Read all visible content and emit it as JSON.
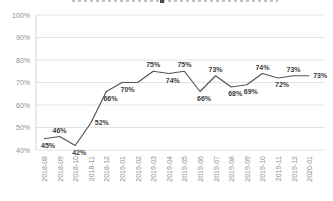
{
  "chart_data": {
    "type": "line",
    "title": "",
    "title_cropped": true,
    "categories": [
      "2018-08",
      "2018-09",
      "2018-10",
      "2018-11",
      "2018-12",
      "2019-01",
      "2019-02",
      "2019-03",
      "2019-04",
      "2019-05",
      "2019-06",
      "2019-07",
      "2019-08",
      "2019-09",
      "2019-10",
      "2019-11",
      "2019-12",
      "2020-01"
    ],
    "series": [
      {
        "name": "percentage",
        "values": [
          45,
          46,
          42,
          52,
          66,
          70,
          70,
          75,
          74,
          75,
          66,
          73,
          68,
          69,
          74,
          72,
          73,
          73
        ],
        "data_labels": [
          "45%",
          "46%",
          "42%",
          "52%",
          "66%",
          null,
          "70%",
          "75%",
          "74%",
          "75%",
          "66%",
          "73%",
          "68%",
          "69%",
          "74%",
          "72%",
          "73%",
          "73%"
        ],
        "label_side": [
          "below",
          "above",
          "below",
          "right",
          "below",
          null,
          "below-left",
          "above",
          "below",
          "above",
          "below",
          "above",
          "below",
          "below",
          "above",
          "below",
          "above",
          "right"
        ]
      }
    ],
    "y_ticks": [
      "100%",
      "90%",
      "80%",
      "70%",
      "60%",
      "50%",
      "40%"
    ],
    "y_tick_values": [
      100,
      90,
      80,
      70,
      60,
      50,
      40
    ],
    "ylim": [
      40,
      100
    ],
    "xlabel": "",
    "ylabel": "",
    "grid": true,
    "legend": false,
    "colors": {
      "line": "#555555",
      "data_label": "#3b3b3b",
      "axis_text": "#8f8f8f",
      "gridline": "#e4e4e4",
      "axis_line": "#d2d2d2",
      "background": "#ffffff"
    }
  }
}
